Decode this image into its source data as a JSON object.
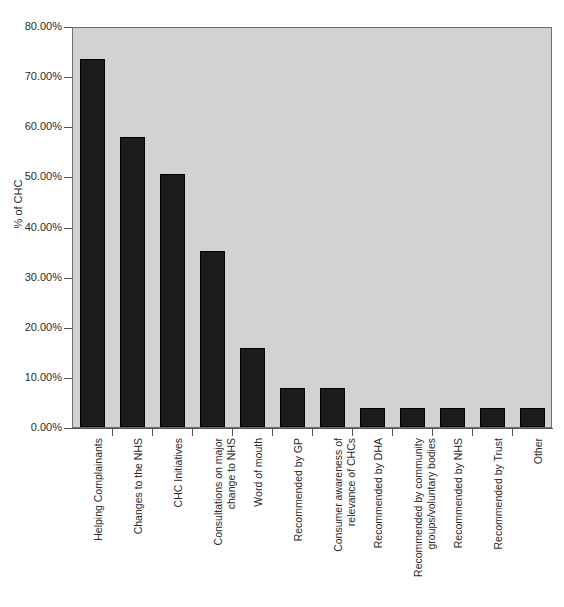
{
  "chart_data": {
    "type": "bar",
    "title": "",
    "subtitle": "",
    "xlabel": "",
    "ylabel": "% of CHC",
    "ylim": [
      0,
      80
    ],
    "ytick_values": [
      0,
      10,
      20,
      30,
      40,
      50,
      60,
      70,
      80
    ],
    "ytick_labels": [
      "0.00%",
      "10.00%",
      "20.00%",
      "30.00%",
      "40.00%",
      "50.00%",
      "60.00%",
      "70.00%",
      "80.00%"
    ],
    "grid": false,
    "legend": null,
    "legend_position": "none",
    "bar_color": "#1c1c1c",
    "plot_background_color": "#d2d2d2",
    "page_background_color": "#ffffff",
    "axis_color": "#555555",
    "categories": [
      "Helping Complainants",
      "Changes to the NHS",
      "CHC Initiatives",
      "Consultations on major change to NHS",
      "Word of mouth",
      "Recommended by GP",
      "Consumer awareness of relevance of CHCs",
      "Recommended by DHA",
      "Recommended by community groups/voluntary bodies",
      "Recommended by NHS",
      "Recommended by Trust",
      "Other"
    ],
    "category_label_lines": [
      [
        "Helping Complainants"
      ],
      [
        "Changes to the NHS"
      ],
      [
        "CHC Initiatives"
      ],
      [
        "Consultations on major",
        "change to NHS"
      ],
      [
        "Word of mouth"
      ],
      [
        "Recommended by GP"
      ],
      [
        "Consumer awareness of",
        "relevance of CHCs"
      ],
      [
        "Recommended by DHA"
      ],
      [
        "Recommended by community",
        "groups/voluntary bodies"
      ],
      [
        "Recommended by NHS"
      ],
      [
        "Recommended by Trust"
      ],
      [
        "Other"
      ]
    ],
    "values": [
      73.5,
      57.9,
      50.5,
      35.2,
      15.8,
      7.7,
      7.7,
      3.8,
      3.8,
      3.8,
      3.8,
      3.8
    ],
    "value_labels": [
      "73.50%",
      "57.90%",
      "50.50%",
      "35.20%",
      "15.80%",
      "7.70%",
      "7.70%",
      "3.80%",
      "3.80%",
      "3.80%",
      "3.80%",
      "3.80%"
    ]
  }
}
